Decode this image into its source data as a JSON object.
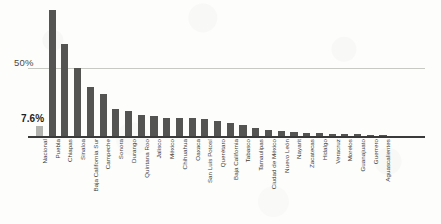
{
  "chart_data": {
    "type": "bar",
    "title": "",
    "subtitle": "",
    "xlabel": "",
    "ylabel": "",
    "ylim": [
      0,
      100
    ],
    "grid": true,
    "legend": "none",
    "orientation": "vertical",
    "bar_color": "#545452",
    "highlight_color": "#b2b2ae",
    "highlight_category": "Nacional",
    "yticks": [
      {
        "value": 50,
        "label": "50%"
      }
    ],
    "data_labels": [
      {
        "category": "Nacional",
        "label": "7.6%"
      }
    ],
    "categories": [
      "Nacional",
      "Puebla",
      "Chiapas",
      "Sinaloa",
      "Baja California Sur",
      "Campeche",
      "Sonora",
      "Durango",
      "Quintana Roo",
      "Jalisco",
      "México",
      "Chihuahua",
      "Oaxaca",
      "San Luis Potosí",
      "Querétaro",
      "Baja California",
      "Tabasco",
      "Tamaulipas",
      "Ciudad de México",
      "Nuevo León",
      "Nayarit",
      "Zacatecas",
      "Hidalgo",
      "Veracruz",
      "Morelos",
      "Guanajuato",
      "Guerrero",
      "Aguascalientes"
    ],
    "values": [
      7.6,
      92.0,
      67.0,
      50.0,
      35.5,
      30.5,
      19.5,
      18.5,
      15.0,
      14.5,
      13.5,
      13.5,
      13.0,
      12.5,
      11.0,
      9.5,
      8.0,
      6.0,
      4.5,
      4.0,
      3.0,
      2.5,
      2.0,
      1.8,
      1.5,
      1.2,
      1.0,
      0.8
    ]
  }
}
